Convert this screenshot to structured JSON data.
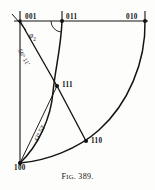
{
  "figure": {
    "caption_prefix": "F",
    "caption_smallcaps": "IG",
    "caption_number": ". 389.",
    "caption_full": "FIG. 389.",
    "type": "stereographic-projection-crystallography"
  },
  "colors": {
    "ink": "#101010",
    "paper": "#fdfdfb",
    "line": "#1a1a1a"
  },
  "points": [
    {
      "id": "p001",
      "label": "001",
      "x": 20,
      "y": 21,
      "label_dx": 4,
      "label_dy": -8,
      "marker": "cross"
    },
    {
      "id": "p011",
      "label": "011",
      "x": 62,
      "y": 21,
      "label_dx": 4,
      "label_dy": -8,
      "marker": "dot"
    },
    {
      "id": "p010",
      "label": "010",
      "x": 145,
      "y": 21,
      "label_dx": -22,
      "label_dy": -8,
      "marker": "dot"
    },
    {
      "id": "p111",
      "label": "111",
      "x": 57,
      "y": 86,
      "label_dx": 5,
      "label_dy": -3,
      "marker": "dot"
    },
    {
      "id": "p110",
      "label": "110",
      "x": 86,
      "y": 141,
      "label_dx": 5,
      "label_dy": -2,
      "marker": "dot"
    },
    {
      "id": "p100",
      "label": "100",
      "x": 20,
      "y": 163,
      "label_dx": -3,
      "label_dy": 3,
      "marker": "dot"
    }
  ],
  "angles": [
    {
      "id": "phi2",
      "text": "φ",
      "sub": "2",
      "x": 29,
      "y": 34,
      "rotate": 0
    },
    {
      "id": "a5611",
      "text": "56° 11'",
      "x": 20,
      "y": 50,
      "rotate": 64
    },
    {
      "id": "a4352",
      "text": "43° 52'",
      "x": 31,
      "y": 141,
      "rotate": -61
    }
  ],
  "edges": [
    {
      "id": "top-axis",
      "kind": "line",
      "from": "001-left",
      "to": "010",
      "desc": "horizontal top axis 001 to 010"
    },
    {
      "id": "left-axis",
      "kind": "line",
      "from": "001",
      "to": "100",
      "desc": "vertical left axis 001 to 100"
    },
    {
      "id": "zone-001-111",
      "kind": "line",
      "from": "001",
      "to": "111",
      "desc": "straight zone line 001 to 111, angle 56 deg 11 min"
    },
    {
      "id": "zone-111-110",
      "kind": "line",
      "from": "111",
      "to": "110",
      "desc": "straight zone line 111 to 110"
    },
    {
      "id": "zone-100-111",
      "kind": "line",
      "from": "100",
      "to": "111",
      "desc": "straight zone line 100 to 111, angle 43 deg 52 min"
    },
    {
      "id": "arc-011-100",
      "kind": "arc",
      "from": "011",
      "to": "100",
      "desc": "great circle arc 011 through 111 to 100"
    },
    {
      "id": "arc-010-100",
      "kind": "arc",
      "from": "010",
      "to": "100",
      "desc": "great circle arc 010 through 110 to 100"
    },
    {
      "id": "angle-arc-011",
      "kind": "arc",
      "at": "011",
      "desc": "interior angle marker arc at 011"
    }
  ],
  "ticks": [
    {
      "id": "tick-001",
      "x": 20,
      "desc": "tick above 001"
    },
    {
      "id": "tick-011",
      "x": 62,
      "desc": "tick above 011"
    },
    {
      "id": "tick-010",
      "x": 145,
      "desc": "tick above 010"
    }
  ]
}
